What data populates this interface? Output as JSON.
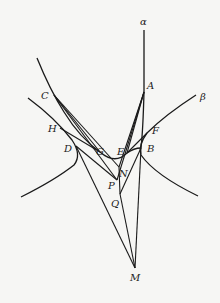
{
  "diagram": {
    "type": "geometry-figure",
    "curve_labels": [
      {
        "id": "alpha",
        "text": "α",
        "x": 143,
        "y": 24
      },
      {
        "id": "beta",
        "text": "β",
        "x": 203,
        "y": 99
      }
    ],
    "points": [
      {
        "id": "A",
        "text": "A",
        "x": 144,
        "y": 92,
        "lx": 148,
        "ly": 89
      },
      {
        "id": "B",
        "text": "B",
        "x": 141,
        "y": 148,
        "lx": 148,
        "ly": 151
      },
      {
        "id": "C",
        "text": "C",
        "x": 54,
        "y": 95,
        "lx": 41,
        "ly": 98
      },
      {
        "id": "D",
        "text": "D",
        "x": 76,
        "y": 146,
        "lx": 64,
        "ly": 151
      },
      {
        "id": "E",
        "text": "E",
        "x": 127,
        "y": 153,
        "lx": 117,
        "ly": 153
      },
      {
        "id": "F",
        "text": "F",
        "x": 147,
        "y": 133,
        "lx": 152,
        "ly": 135
      },
      {
        "id": "G",
        "text": "G",
        "x": 100,
        "y": 152,
        "lx": 96,
        "ly": 154
      },
      {
        "id": "H",
        "text": "H",
        "x": 60,
        "y": 128,
        "lx": 48,
        "ly": 132
      },
      {
        "id": "N",
        "text": "N",
        "x": 119,
        "y": 167,
        "lx": 118,
        "ly": 177
      },
      {
        "id": "P",
        "text": "P",
        "x": 117,
        "y": 180,
        "lx": 108,
        "ly": 188
      },
      {
        "id": "Q",
        "text": "Q",
        "x": 120,
        "y": 194,
        "lx": 112,
        "ly": 206
      },
      {
        "id": "M",
        "text": "M",
        "x": 135,
        "y": 268,
        "lx": 131,
        "ly": 280
      }
    ]
  }
}
